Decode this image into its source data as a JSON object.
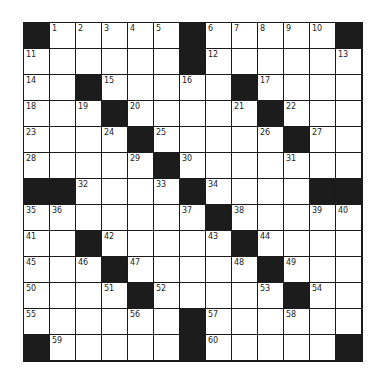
{
  "puzzle": {
    "rows": 13,
    "cols": 13,
    "grid": [
      [
        "#",
        "1",
        "2",
        "3",
        "4",
        "5",
        "#",
        "6",
        "7",
        "8",
        "9",
        "10",
        "#"
      ],
      [
        "11",
        "",
        "",
        "",
        "",
        "",
        "#",
        "12",
        "",
        "",
        "",
        "",
        "13"
      ],
      [
        "14",
        "",
        "#",
        "15",
        "",
        "",
        "16",
        "",
        "#",
        "17",
        "",
        "",
        ""
      ],
      [
        "18",
        "",
        "19",
        "#",
        "20",
        "",
        "",
        "",
        "21",
        "#",
        "22",
        "",
        ""
      ],
      [
        "23",
        "",
        "",
        "24",
        "#",
        "25",
        "",
        "",
        "",
        "26",
        "#",
        "27",
        ""
      ],
      [
        "28",
        "",
        "",
        "",
        "29",
        "#",
        "30",
        "",
        "",
        "",
        "31",
        "",
        ""
      ],
      [
        "#",
        "#",
        "32",
        "",
        "",
        "33",
        "#",
        "34",
        "",
        "",
        "",
        "#",
        "#"
      ],
      [
        "35",
        "36",
        "",
        "",
        "",
        "",
        "37",
        "#",
        "38",
        "",
        "",
        "39",
        "40"
      ],
      [
        "41",
        "",
        "#",
        "42",
        "",
        "",
        "",
        "43",
        "#",
        "44",
        "",
        "",
        ""
      ],
      [
        "45",
        "",
        "46",
        "#",
        "47",
        "",
        "",
        "",
        "48",
        "#",
        "49",
        "",
        ""
      ],
      [
        "50",
        "",
        "",
        "51",
        "#",
        "52",
        "",
        "",
        "",
        "53",
        "#",
        "54",
        ""
      ],
      [
        "55",
        "",
        "",
        "",
        "56",
        "",
        "#",
        "57",
        "",
        "",
        "58",
        "",
        ""
      ],
      [
        "#",
        "59",
        "",
        "",
        "",
        "",
        "#",
        "60",
        "",
        "",
        "",
        "",
        "#"
      ]
    ],
    "colors": {
      "black_cell": "#1c1c1c",
      "white_cell": "#ffffff",
      "grid_line": "#1a1a1a"
    }
  }
}
